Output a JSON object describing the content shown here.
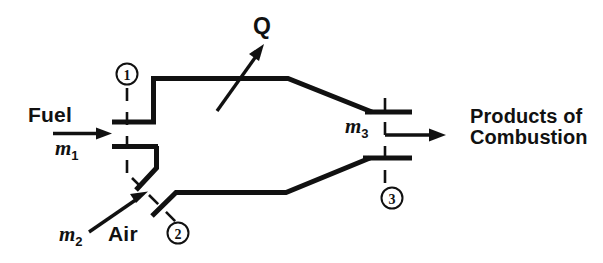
{
  "diagram": {
    "type": "engineering-schematic",
    "background_color": "#ffffff",
    "line_color": "#111111",
    "labels": {
      "fuel": "Fuel",
      "air": "Air",
      "heat": "Q",
      "mass_flow_fuel": "m",
      "mass_flow_fuel_sub": "1",
      "mass_flow_air": "m",
      "mass_flow_air_sub": "2",
      "mass_flow_products": "m",
      "mass_flow_products_sub": "3",
      "products_line1": "Products of",
      "products_line2": "Combustion"
    },
    "stations": [
      {
        "id": "1",
        "label": "1",
        "cx": 127,
        "cy": 74,
        "r": 10,
        "description": "fuel inlet station"
      },
      {
        "id": "2",
        "label": "2",
        "cx": 178,
        "cy": 233,
        "r": 10,
        "description": "air inlet station"
      },
      {
        "id": "3",
        "label": "3",
        "cx": 392,
        "cy": 198,
        "r": 10,
        "description": "products exit station"
      }
    ],
    "streams": [
      {
        "name": "fuel-inlet",
        "label": "Fuel",
        "flow": "m1",
        "direction": "right"
      },
      {
        "name": "air-inlet",
        "label": "Air",
        "flow": "m2",
        "direction": "up-right"
      },
      {
        "name": "products-exit",
        "label": "Products of Combustion",
        "flow": "m3",
        "direction": "right"
      },
      {
        "name": "heat-transfer",
        "label": "Q",
        "flow": "Q",
        "direction": "up-right"
      }
    ]
  }
}
